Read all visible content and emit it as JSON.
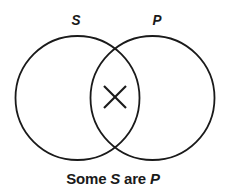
{
  "diagram": {
    "type": "venn",
    "sets": [
      {
        "id": "S",
        "label": "S",
        "cx": 77.5,
        "cy": 98,
        "r": 62
      },
      {
        "id": "P",
        "label": "P",
        "cx": 152.5,
        "cy": 98,
        "r": 62
      }
    ],
    "marks": [
      {
        "type": "x-mark",
        "region": "S∩P",
        "cx": 115,
        "cy": 97,
        "size": 24
      }
    ],
    "caption": {
      "word1": "Some ",
      "subject": "S",
      "word2": " are ",
      "predicate": "P"
    },
    "colors": {
      "stroke": "#1a1a1a",
      "background": "#ffffff"
    }
  }
}
